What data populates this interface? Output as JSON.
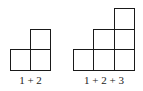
{
  "figures": [
    {
      "label": "1 + 2",
      "squares": [
        {
          "x": 10,
          "y": 49,
          "w": 21,
          "h": 22
        },
        {
          "x": 30,
          "y": 49,
          "w": 21,
          "h": 22
        },
        {
          "x": 30,
          "y": 29,
          "w": 21,
          "h": 21
        }
      ],
      "label_x": 10,
      "label_w": 41,
      "label_y": 74
    },
    {
      "label": "1 + 2 + 3",
      "squares": [
        {
          "x": 73,
          "y": 49,
          "w": 21,
          "h": 22
        },
        {
          "x": 93,
          "y": 49,
          "w": 22,
          "h": 22
        },
        {
          "x": 114,
          "y": 49,
          "w": 21,
          "h": 22
        },
        {
          "x": 93,
          "y": 29,
          "w": 22,
          "h": 21
        },
        {
          "x": 114,
          "y": 29,
          "w": 21,
          "h": 21
        },
        {
          "x": 114,
          "y": 8,
          "w": 21,
          "h": 22
        }
      ],
      "label_x": 73,
      "label_w": 62,
      "label_y": 74
    }
  ],
  "style": {
    "stroke": "#1a1a1a"
  }
}
